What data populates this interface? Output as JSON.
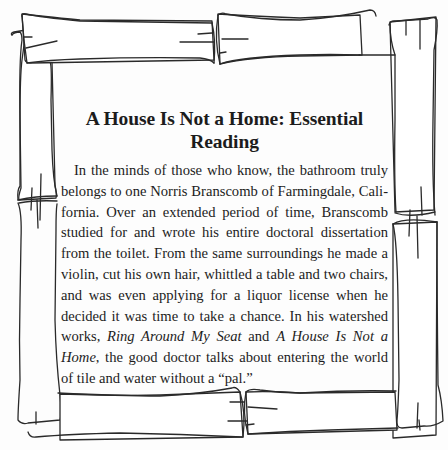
{
  "article": {
    "title": "A House Is Not a Home: Essential Reading",
    "paragraph": {
      "part1": "In the minds of those who know, the bathroom truly belongs to one Norris Branscomb of Farmingdale, Cali­fornia. Over an extended period of time, Branscomb studied for and wrote his entire doctoral dissertation from the toilet. From the same surroundings he made a violin, cut his own hair, whittled a table and two chairs, and was even applying for a liquor license when he decided it was time to take a chance. In his watershed works, ",
      "book1": "Ring Around My Seat",
      "between": " and ",
      "book2": "A House Is Not a Home",
      "part2": ", the good doctor talks about entering the world of tile and water without a “pal.”"
    }
  },
  "frame": {
    "style": "hand-drawn log border",
    "stroke_color": "#2a2a2a",
    "background_color": "#fdfdfd"
  }
}
